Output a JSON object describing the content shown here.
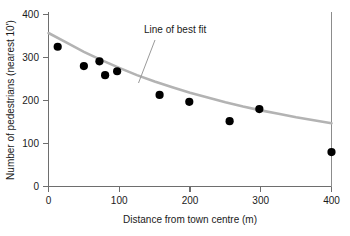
{
  "chart_data": {
    "type": "scatter",
    "title": "",
    "xlabel": "Distance from town centre (m)",
    "ylabel": "Number of pedestrians (nearest 10')",
    "xlim": [
      0,
      400
    ],
    "ylim": [
      0,
      400
    ],
    "xticks": [
      0,
      100,
      200,
      300,
      400
    ],
    "yticks": [
      0,
      100,
      200,
      300,
      400
    ],
    "xticklabels": [
      "0",
      "100",
      "200",
      "300",
      "400"
    ],
    "yticklabels": [
      "0",
      "100",
      "200",
      "300",
      "400"
    ],
    "grid": false,
    "legend": null,
    "annotations": [
      {
        "text": "Line of best fit",
        "x": 175,
        "y": 355,
        "points_to_x": 150,
        "points_to_y": 215
      }
    ],
    "series": [
      {
        "name": "Observations",
        "type": "scatter",
        "marker": "filled-circle",
        "color": "#000000",
        "points": [
          {
            "x": 13,
            "y": 325
          },
          {
            "x": 50,
            "y": 280
          },
          {
            "x": 72,
            "y": 291
          },
          {
            "x": 80,
            "y": 259
          },
          {
            "x": 97,
            "y": 268
          },
          {
            "x": 157,
            "y": 213
          },
          {
            "x": 199,
            "y": 197
          },
          {
            "x": 256,
            "y": 152
          },
          {
            "x": 298,
            "y": 180
          },
          {
            "x": 400,
            "y": 80
          }
        ]
      },
      {
        "name": "Line of best fit",
        "type": "line",
        "color": "#b3b3b3",
        "points": [
          {
            "x": 0,
            "y": 357
          },
          {
            "x": 25,
            "y": 335
          },
          {
            "x": 50,
            "y": 313
          },
          {
            "x": 75,
            "y": 294
          },
          {
            "x": 100,
            "y": 276
          },
          {
            "x": 125,
            "y": 259
          },
          {
            "x": 150,
            "y": 244
          },
          {
            "x": 175,
            "y": 231
          },
          {
            "x": 200,
            "y": 218
          },
          {
            "x": 225,
            "y": 207
          },
          {
            "x": 250,
            "y": 196
          },
          {
            "x": 275,
            "y": 186
          },
          {
            "x": 300,
            "y": 177
          },
          {
            "x": 325,
            "y": 169
          },
          {
            "x": 350,
            "y": 161
          },
          {
            "x": 375,
            "y": 154
          },
          {
            "x": 400,
            "y": 147
          }
        ]
      }
    ]
  }
}
